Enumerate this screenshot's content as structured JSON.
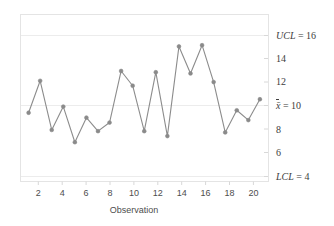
{
  "chart_data": {
    "type": "line",
    "title": "",
    "subtitle": "",
    "xlabel": "Observation",
    "ylabel": "",
    "x": [
      1,
      2,
      3,
      4,
      5,
      6,
      7,
      8,
      9,
      10,
      11,
      12,
      13,
      14,
      15,
      16,
      17,
      18,
      19,
      20,
      21
    ],
    "values": [
      9.0,
      11.6,
      7.6,
      9.5,
      6.6,
      8.6,
      7.5,
      8.2,
      12.4,
      11.2,
      7.5,
      12.3,
      7.1,
      14.4,
      12.2,
      14.5,
      11.5,
      7.4,
      9.2,
      8.4,
      10.1
    ],
    "series": [
      {
        "name": "Observation value",
        "values": [
          9.0,
          11.6,
          7.6,
          9.5,
          6.6,
          8.6,
          7.5,
          8.2,
          12.4,
          11.2,
          7.5,
          12.3,
          7.1,
          14.4,
          12.2,
          14.5,
          11.5,
          7.4,
          9.2,
          8.4,
          10.1
        ]
      }
    ],
    "xlim": [
      0.3,
      21.7
    ],
    "ylim": [
      3.4,
      17.0
    ],
    "xticks": [
      2,
      4,
      6,
      8,
      10,
      12,
      14,
      16,
      18,
      20
    ],
    "xticklabels": [
      "2",
      "4",
      "6",
      "8",
      "10",
      "12",
      "14",
      "16",
      "18",
      "20"
    ],
    "yticks": [
      4,
      6,
      8,
      10,
      12,
      14,
      16
    ],
    "yticklabels": [
      "LCL = 4",
      "6",
      "8",
      "x̄ = 10",
      "12",
      "14",
      "UCL = 16"
    ],
    "grid": true,
    "legend": "none",
    "reference_lines": [
      {
        "name": "UCL",
        "label": "UCL = 16",
        "value": 16,
        "kind": "upper-control-limit"
      },
      {
        "name": "CL",
        "label": "x̄ = 10",
        "value": 10,
        "kind": "center-line"
      },
      {
        "name": "LCL",
        "label": "LCL = 4",
        "value": 4,
        "kind": "lower-control-limit"
      }
    ],
    "colors": {
      "line": "#8c8c8c",
      "marker": "#8a8a8a",
      "gridline": "#ededed",
      "frame": "#e0e0e0",
      "text": "#3d3d3d"
    },
    "marker": "circle"
  },
  "axis": {
    "x_title": "Observation",
    "right_labels": [
      {
        "id": "ucl",
        "prefix": "UCL",
        "eq": " = ",
        "value": "16",
        "italic": true
      },
      {
        "id": "y14",
        "prefix": "",
        "eq": "",
        "value": "14",
        "italic": false
      },
      {
        "id": "y12",
        "prefix": "",
        "eq": "",
        "value": "12",
        "italic": false
      },
      {
        "id": "cl",
        "prefix": "x̄",
        "eq": " = ",
        "value": "10",
        "italic": true
      },
      {
        "id": "y8",
        "prefix": "",
        "eq": "",
        "value": "8",
        "italic": false
      },
      {
        "id": "y6",
        "prefix": "",
        "eq": "",
        "value": "6",
        "italic": false
      },
      {
        "id": "lcl",
        "prefix": "LCL",
        "eq": " = ",
        "value": "4",
        "italic": true
      }
    ]
  },
  "labels": {
    "ucl": "UCL = 16",
    "y14": "14",
    "y12": "12",
    "cl_prefix": "x̄",
    "cl_value": " = 10",
    "y8": "8",
    "y6": "6",
    "lcl": "LCL = 4",
    "x2": "2",
    "x4": "4",
    "x6": "6",
    "x8": "8",
    "x10": "10",
    "x12": "12",
    "x14": "14",
    "x16": "16",
    "x18": "18",
    "x20": "20",
    "ucl_prefix": "UCL",
    "ucl_value": " = 16",
    "lcl_prefix": "LCL",
    "lcl_value": " = 4"
  }
}
